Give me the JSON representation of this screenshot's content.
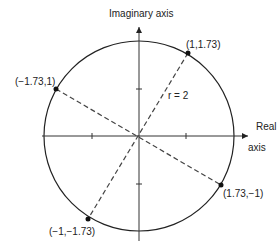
{
  "diagram": {
    "axes": {
      "imaginary_label": "Imaginary axis",
      "real_label_line1": "Real",
      "real_label_line2": "axis"
    },
    "circle": {
      "radius_label": "r = 2",
      "radius": 2
    },
    "points": [
      {
        "label": "(1,1.73)",
        "re": 1,
        "im": 1.73
      },
      {
        "label": "(−1.73,1)",
        "re": -1.73,
        "im": 1
      },
      {
        "label": "(1.73,−1)",
        "re": 1.73,
        "im": -1
      },
      {
        "label": "(−1,−1.73)",
        "re": -1,
        "im": -1.73
      }
    ],
    "colors": {
      "stroke": "#222222",
      "dash": "#444444",
      "background": "#ffffff"
    }
  }
}
